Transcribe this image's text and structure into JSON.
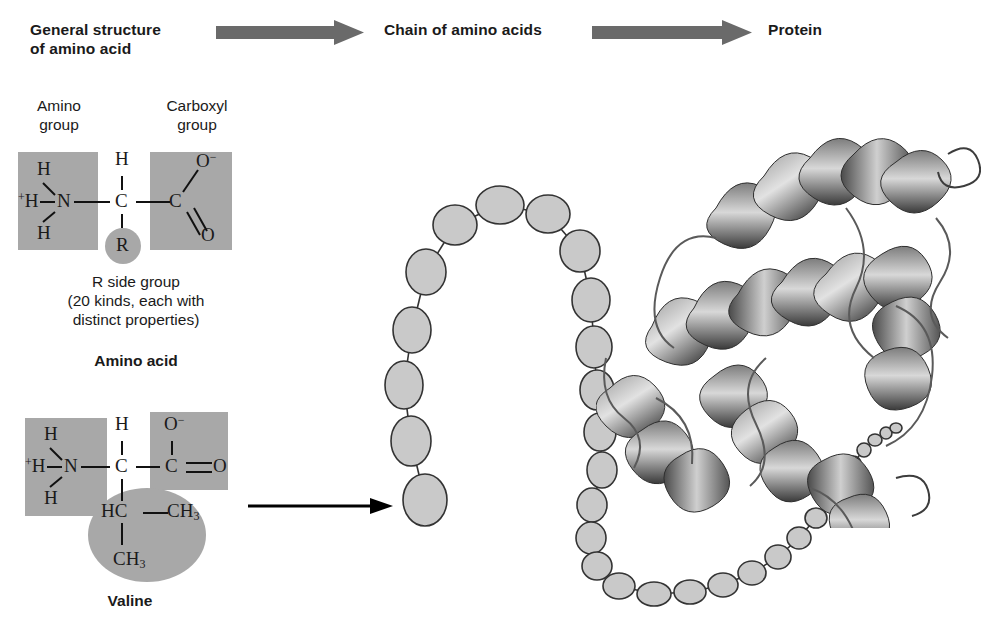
{
  "header": {
    "stage1": "General structure\nof amino acid",
    "stage1_line1": "General structure",
    "stage1_line2": "of amino acid",
    "stage2": "Chain of amino acids",
    "stage3": "Protein",
    "arrow1_name": "block-arrow",
    "arrow2_name": "block-arrow",
    "arrow_color": "#6a6a6a"
  },
  "general_structure": {
    "amino_group_label_l1": "Amino",
    "amino_group_label_l2": "group",
    "carboxyl_group_label_l1": "Carboxyl",
    "carboxyl_group_label_l2": "group",
    "atoms": {
      "h_top_left": "H",
      "h_plus": "+H",
      "n": "N",
      "h_bottom_left": "H",
      "h_top_center": "H",
      "c_alpha": "C",
      "r": "R",
      "c_carboxyl": "C",
      "o_minus": "O",
      "o_minus_charge": "−",
      "o_double": "O"
    },
    "caption_l1": "R side group",
    "caption_l2": "(20 kinds, each with",
    "caption_l3": "distinct properties)",
    "title": "Amino acid",
    "box_color": "#a8a8a8"
  },
  "valine": {
    "atoms": {
      "h_top_left": "H",
      "h_plus": "+H",
      "n": "N",
      "h_bottom_left": "H",
      "h_top_center": "H",
      "c_alpha": "C",
      "c_carboxyl": "C",
      "o_minus": "O",
      "o_minus_charge": "−",
      "o_double": "O",
      "hc": "HC",
      "ch3_right": "CH",
      "ch3_right_sub": "3",
      "ch3_bottom": "CH",
      "ch3_bottom_sub": "3"
    },
    "title": "Valine",
    "box_color": "#a8a8a8",
    "side_chain_ellipse_color": "#a8a8a8"
  },
  "transition_arrow": {
    "name": "arrow-valine-to-chain",
    "color": "#000000"
  },
  "chain": {
    "bead_fill": "#c9c9c9",
    "bead_stroke": "#333333",
    "description": "chain of amino acid beads",
    "beads": [
      {
        "cx": 425,
        "cy": 500,
        "rx": 22,
        "ry": 26
      },
      {
        "cx": 411,
        "cy": 441,
        "rx": 20,
        "ry": 25
      },
      {
        "cx": 404,
        "cy": 385,
        "rx": 19,
        "ry": 24
      },
      {
        "cx": 412,
        "cy": 330,
        "rx": 19,
        "ry": 23
      },
      {
        "cx": 426,
        "cy": 272,
        "rx": 20,
        "ry": 23
      },
      {
        "cx": 455,
        "cy": 225,
        "rx": 22,
        "ry": 20
      },
      {
        "cx": 500,
        "cy": 205,
        "rx": 24,
        "ry": 19
      },
      {
        "cx": 548,
        "cy": 214,
        "rx": 22,
        "ry": 19
      },
      {
        "cx": 580,
        "cy": 251,
        "rx": 20,
        "ry": 21
      },
      {
        "cx": 591,
        "cy": 300,
        "rx": 19,
        "ry": 22
      },
      {
        "cx": 594,
        "cy": 347,
        "rx": 18,
        "ry": 21
      },
      {
        "cx": 597,
        "cy": 390,
        "rx": 17,
        "ry": 20
      },
      {
        "cx": 600,
        "cy": 432,
        "rx": 16,
        "ry": 19
      },
      {
        "cx": 602,
        "cy": 470,
        "rx": 15,
        "ry": 18
      },
      {
        "cx": 592,
        "cy": 505,
        "rx": 15,
        "ry": 17
      },
      {
        "cx": 591,
        "cy": 538,
        "rx": 15,
        "ry": 16
      },
      {
        "cx": 597,
        "cy": 566,
        "rx": 15,
        "ry": 14
      },
      {
        "cx": 619,
        "cy": 586,
        "rx": 16,
        "ry": 13
      },
      {
        "cx": 654,
        "cy": 594,
        "rx": 17,
        "ry": 12
      },
      {
        "cx": 690,
        "cy": 592,
        "rx": 16,
        "ry": 12
      },
      {
        "cx": 723,
        "cy": 585,
        "rx": 15,
        "ry": 12
      },
      {
        "cx": 752,
        "cy": 573,
        "rx": 14,
        "ry": 12
      },
      {
        "cx": 778,
        "cy": 557,
        "rx": 13,
        "ry": 12
      },
      {
        "cx": 799,
        "cy": 538,
        "rx": 12,
        "ry": 11
      },
      {
        "cx": 816,
        "cy": 518,
        "rx": 11,
        "ry": 10
      },
      {
        "cx": 830,
        "cy": 498,
        "rx": 10,
        "ry": 9
      },
      {
        "cx": 842,
        "cy": 480,
        "rx": 9,
        "ry": 8
      },
      {
        "cx": 853,
        "cy": 463,
        "rx": 8,
        "ry": 7
      },
      {
        "cx": 864,
        "cy": 450,
        "rx": 7,
        "ry": 7
      },
      {
        "cx": 875,
        "cy": 440,
        "rx": 7,
        "ry": 6
      },
      {
        "cx": 886,
        "cy": 433,
        "rx": 6,
        "ry": 6
      },
      {
        "cx": 896,
        "cy": 428,
        "rx": 6,
        "ry": 5
      }
    ]
  },
  "protein": {
    "name": "protein-ribbon-structure",
    "description": "Grayscale ribbon diagram of a folded protein with alpha helices",
    "ribbon_dark": "#2e2e2e",
    "ribbon_mid": "#6f6f6f",
    "ribbon_light": "#a9a9a9"
  }
}
